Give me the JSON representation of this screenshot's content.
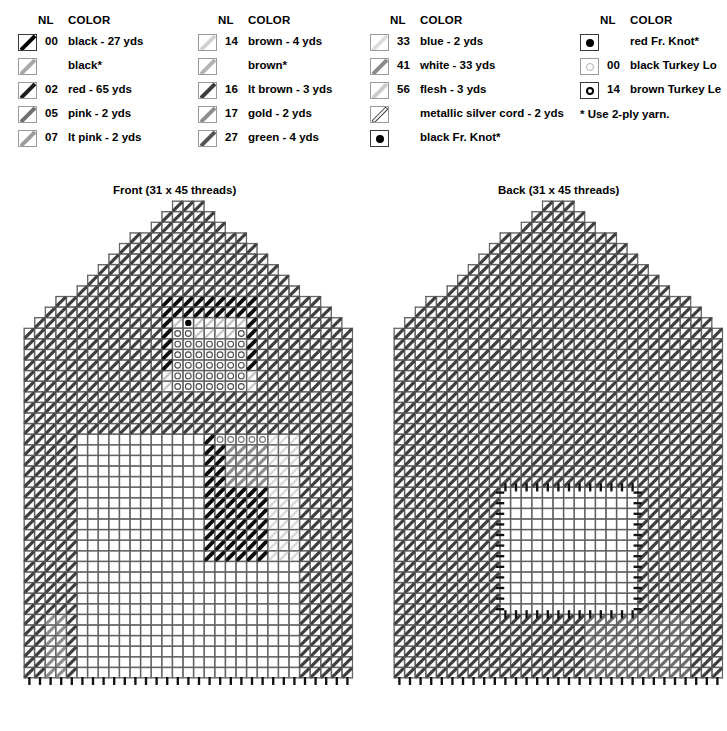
{
  "legend": {
    "header_nl": "NL",
    "header_color": "COLOR",
    "columns": [
      {
        "x": 0,
        "rows": [
          {
            "symbol": "diagonal-bar",
            "shade": "#000000",
            "nl": "00",
            "color": "black - 27 yds"
          },
          {
            "symbol": "diagonal-bar",
            "shade": "#a8a8a8",
            "nl": "",
            "color": "black*"
          },
          {
            "symbol": "diagonal-bar",
            "shade": "#1c1c1c",
            "nl": "02",
            "color": "red - 65 yds"
          },
          {
            "symbol": "diagonal-bar",
            "shade": "#707070",
            "nl": "05",
            "color": "pink - 2 yds"
          },
          {
            "symbol": "diagonal-bar",
            "shade": "#9c9c9c",
            "nl": "07",
            "color": "lt pink - 2 yds"
          }
        ]
      },
      {
        "x": 180,
        "rows": [
          {
            "symbol": "diagonal-bar",
            "shade": "#d2d2d2",
            "nl": "14",
            "color": "brown - 4 yds"
          },
          {
            "symbol": "diagonal-bar",
            "shade": "#b4b4b4",
            "nl": "",
            "color": "brown*"
          },
          {
            "symbol": "diagonal-bar",
            "shade": "#3c3c3c",
            "nl": "16",
            "color": "lt brown - 3 yds"
          },
          {
            "symbol": "diagonal-bar",
            "shade": "#8e8e8e",
            "nl": "17",
            "color": "gold - 2 yds"
          },
          {
            "symbol": "diagonal-bar",
            "shade": "#555555",
            "nl": "27",
            "color": "green - 4 yds"
          }
        ]
      },
      {
        "x": 352,
        "rows": [
          {
            "symbol": "diagonal-bar",
            "shade": "#dcdcdc",
            "nl": "33",
            "color": "blue - 2 yds"
          },
          {
            "symbol": "diagonal-bar",
            "shade": "#8a8a8a",
            "nl": "41",
            "color": "white - 33 yds"
          },
          {
            "symbol": "diagonal-bar",
            "shade": "#cccccc",
            "nl": "56",
            "color": "flesh - 3 yds"
          },
          {
            "symbol": "diagonal-outline",
            "shade": "#ffffff",
            "nl": "",
            "color": "metallic silver cord - 2 yds"
          },
          {
            "symbol": "filled-dot",
            "shade": "#000000",
            "nl": "",
            "color": "black Fr. Knot*"
          }
        ]
      },
      {
        "x": 562,
        "rows": [
          {
            "symbol": "filled-dot",
            "shade": "#000000",
            "nl": "",
            "color": "red Fr. Knot*"
          },
          {
            "symbol": "open-circle-light",
            "shade": "#b0b0b0",
            "nl": "00",
            "color": "black Turkey Lo"
          },
          {
            "symbol": "open-circle-bold",
            "shade": "#000000",
            "nl": "14",
            "color": "brown Turkey Le"
          }
        ],
        "footnote": "* Use 2-ply yarn."
      }
    ]
  },
  "charts": [
    {
      "name": "front",
      "title": "Front (31 x 45 threads)",
      "title_x": 113,
      "title_y": 184,
      "x": 22,
      "y": 199,
      "cols": 31,
      "rows": 45,
      "cell": 10.6
    },
    {
      "name": "back",
      "title": "Back (31 x 45 threads)",
      "title_x": 498,
      "title_y": 184,
      "x": 392,
      "y": 199,
      "cols": 31,
      "rows": 45,
      "cell": 10.6
    }
  ],
  "colors": {
    "grid_line": "#555555",
    "cell_outline": "#7d7d7d",
    "stitch_dark": "#111111",
    "stitch_mid": "#3d3d3d",
    "stitch_gray": "#8c8c8c",
    "stitch_light": "#c9c9c9",
    "background": "#ffffff"
  }
}
